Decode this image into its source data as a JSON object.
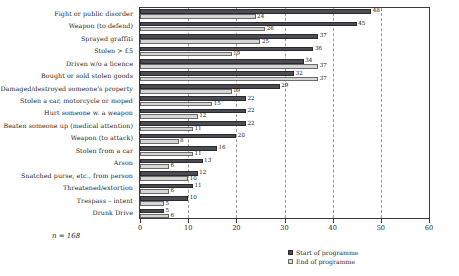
{
  "chart_data": {
    "type": "bar",
    "orientation": "horizontal",
    "title": "",
    "xlabel": "",
    "ylabel": "",
    "xlim": [
      0,
      60
    ],
    "xticks": [
      0,
      10,
      20,
      30,
      40,
      50,
      60
    ],
    "grid": "vertical-dashed",
    "legend_position": "bottom-right",
    "categories": [
      "Fight or public disorder",
      "Weapon (to defend)",
      "Sprayed graffiti",
      "Stolen > £5",
      "Driven w/o a licence",
      "Bought or sold stolen goods",
      "Damaged/destroyed someone's property",
      "Stolen a car, motorcycle or moped",
      "Hurt someone w. a weapon",
      "Beaten someone up (medical attention)",
      "Weapon (to attack)",
      "Stolen from a car",
      "Arson",
      "Snatched purse, etc., from person",
      "Threatened/extortion",
      "Trespass – intent",
      "Drunk Drive"
    ],
    "series": [
      {
        "name": "Start of programme",
        "color": "#4b4b52",
        "values": [
          48,
          45,
          37,
          36,
          34,
          32,
          29,
          22,
          22,
          22,
          20,
          16,
          13,
          12,
          11,
          10,
          5
        ]
      },
      {
        "name": "End of programme",
        "color": "#d6d6d6",
        "values": [
          24,
          26,
          25,
          19,
          37,
          37,
          19,
          15,
          12,
          11,
          8,
          11,
          6,
          10,
          6,
          5,
          6
        ]
      }
    ],
    "annotation": "n = 168"
  },
  "legend": {
    "items": [
      {
        "label": "Start of programme"
      },
      {
        "label": "End of programme"
      }
    ]
  },
  "axis": {
    "tick_labels": [
      "0",
      "10",
      "20",
      "30",
      "40",
      "50",
      "60"
    ]
  },
  "footnote": {
    "n_text": "n = 168"
  }
}
